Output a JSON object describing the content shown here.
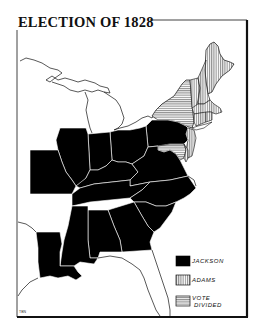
{
  "title": "ELECTION OF 1828",
  "legend": {
    "items": [
      {
        "key": "jackson",
        "label": "JACKSON",
        "pattern": "solid-black"
      },
      {
        "key": "adams",
        "label": "ADAMS",
        "pattern": "vertical-hatch"
      },
      {
        "key": "divided",
        "label_line1": "VOTE",
        "label_line2": "DIVIDED",
        "pattern": "horizontal-hatch"
      }
    ]
  },
  "credit": "TBN",
  "colors": {
    "jackson": "#000000",
    "outline": "#111111",
    "background": "#ffffff"
  },
  "states": {
    "jackson": [
      "Missouri",
      "Illinois",
      "Indiana",
      "Ohio",
      "Kentucky",
      "Tennessee",
      "Pennsylvania",
      "Virginia",
      "North Carolina",
      "South Carolina",
      "Georgia",
      "Alabama",
      "Mississippi",
      "Louisiana"
    ],
    "adams": [
      "Vermont",
      "New Hampshire",
      "Massachusetts",
      "Connecticut",
      "Rhode Island",
      "New Jersey",
      "Delaware"
    ],
    "divided": [
      "Maine",
      "New York",
      "Maryland"
    ]
  }
}
